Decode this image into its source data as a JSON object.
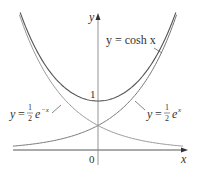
{
  "figure": {
    "axes": {
      "x_label": "x",
      "y_label": "y",
      "origin_label": "0",
      "y_tick_label": "1"
    },
    "curves": [
      {
        "name": "cosh",
        "label_text": "y = cosh x",
        "color": "#555555"
      },
      {
        "name": "half-exp-pos",
        "label_prefix": "y = ",
        "frac_num": "1",
        "frac_den": "2",
        "base": "e",
        "exponent": "x",
        "color": "#888888"
      },
      {
        "name": "half-exp-neg",
        "label_prefix": "y = ",
        "frac_num": "1",
        "frac_den": "2",
        "base": "e",
        "exponent": "−x",
        "color": "#888888"
      }
    ]
  },
  "chart_data": {
    "type": "line",
    "title": "",
    "xlabel": "x",
    "ylabel": "y",
    "series": [
      {
        "name": "y = cosh x",
        "x": [
          -1.65,
          -1,
          -0.5,
          0,
          0.5,
          1,
          1.65
        ],
        "values": [
          2.7,
          1.54,
          1.13,
          1.0,
          1.13,
          1.54,
          2.7
        ]
      },
      {
        "name": "y = 1/2 e^x",
        "x": [
          -1.8,
          -1,
          0,
          1,
          1.68
        ],
        "values": [
          0.08,
          0.18,
          0.5,
          1.36,
          2.68
        ]
      },
      {
        "name": "y = 1/2 e^-x",
        "x": [
          -1.68,
          -1,
          0,
          1,
          1.8
        ],
        "values": [
          2.68,
          1.36,
          0.5,
          0.18,
          0.08
        ]
      }
    ],
    "annotations": [
      "y = cosh x",
      "y = 1/2 e^x",
      "y = 1/2 e^-x",
      "1",
      "0"
    ],
    "grid": false
  }
}
